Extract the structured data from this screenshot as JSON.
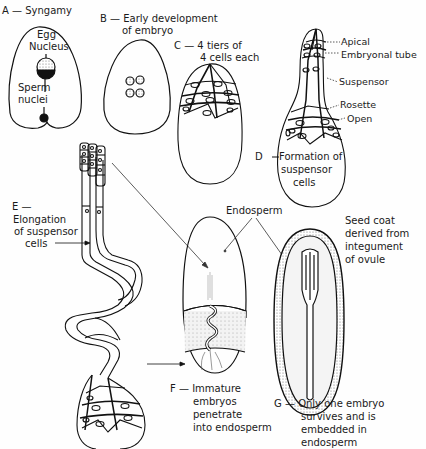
{
  "panels": {
    "A": {
      "letter": "A",
      "title": "Syngamy",
      "labels": {
        "egg_nucleus_1": "Egg",
        "egg_nucleus_2": "Nucleus",
        "sperm_nuclei_1": "Sperm",
        "sperm_nuclei_2": "nuclei"
      }
    },
    "B": {
      "letter": "B",
      "title_1": "Early development",
      "title_2": "of embryo"
    },
    "C": {
      "letter": "C",
      "title_1": "4 tiers of",
      "title_2": "4 cells each"
    },
    "D": {
      "letter": "D",
      "title_1": "Formation of",
      "title_2": "suspensor",
      "title_3": "cells",
      "labels": {
        "apical": "Apical",
        "embryonal_tube": "Embryonal tube",
        "suspensor": "Suspensor",
        "rosette": "Rosette",
        "open": "Open"
      }
    },
    "E": {
      "letter": "E",
      "title_1": "Elongation",
      "title_2": "of suspensor",
      "title_3": "cells"
    },
    "F": {
      "letter": "F",
      "title_1": "Immature",
      "title_2": "embryos",
      "title_3": "penetrate",
      "title_4": "into endosperm",
      "endosperm_label": "Endosperm"
    },
    "G": {
      "letter": "G",
      "title_1": "Only one embryo",
      "title_2": "survives and is",
      "title_3": "embedded in",
      "title_4": "endosperm",
      "seed_coat_1": "Seed coat",
      "seed_coat_2": "derived from",
      "seed_coat_3": "integument",
      "seed_coat_4": "of ovule"
    }
  },
  "dash": "—"
}
